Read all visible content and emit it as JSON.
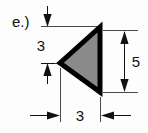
{
  "figure": {
    "problem_label": "e.)",
    "shape": {
      "name": "triangle",
      "orientation": "points-left",
      "fill_color": "#8a8a8a",
      "outline_color": "#000000"
    },
    "dimensions": [
      {
        "id": "top-vertical-3",
        "value": "3",
        "orientation": "vertical",
        "position": "left-upper",
        "describes": "distance from top edge down to triangle left vertex"
      },
      {
        "id": "right-vertical-5",
        "value": "5",
        "orientation": "vertical",
        "position": "right",
        "describes": "triangle vertical side length"
      },
      {
        "id": "bottom-horizontal-3",
        "value": "3",
        "orientation": "horizontal",
        "position": "bottom",
        "describes": "triangle horizontal height / base width"
      }
    ]
  }
}
